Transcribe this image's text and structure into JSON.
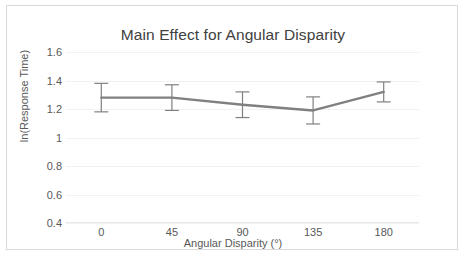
{
  "chart_data": {
    "type": "line",
    "title": "Main Effect for Angular Disparity",
    "xlabel": "Angular Disparity (°)",
    "ylabel": "ln(Response Time)",
    "categories": [
      "0",
      "45",
      "90",
      "135",
      "180"
    ],
    "x": [
      0,
      45,
      90,
      135,
      180
    ],
    "values": [
      1.28,
      1.28,
      1.23,
      1.19,
      1.32
    ],
    "errors": [
      0.1,
      0.09,
      0.09,
      0.095,
      0.07
    ],
    "series": [
      {
        "name": "ln(Response Time)",
        "values": [
          1.28,
          1.28,
          1.23,
          1.19,
          1.32
        ],
        "errors": [
          0.1,
          0.09,
          0.09,
          0.095,
          0.07
        ]
      }
    ],
    "ylim": [
      0.4,
      1.6
    ],
    "yticks": [
      1.6,
      1.4,
      1.2,
      1.0,
      0.8,
      0.6,
      0.4
    ],
    "ytick_labels": [
      "1.6",
      "1.4",
      "1.2",
      "1",
      "0.8",
      "0.6",
      "0.4"
    ],
    "xtick_labels": [
      "0",
      "45",
      "90",
      "135",
      "180"
    ],
    "grid": true,
    "legend": false,
    "legend_position": "none",
    "line_color": "#808080",
    "error_bar_color": "#808080",
    "gridline_color": "#f2f2f2",
    "text_color": "#595959",
    "title_color": "#404040",
    "border_color": "#d9d9d9",
    "background_color": "#ffffff"
  }
}
